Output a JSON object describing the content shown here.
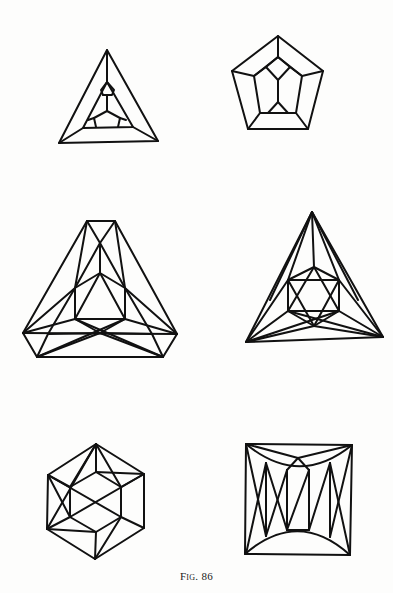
{
  "page": {
    "background": "#fdfdfc",
    "ink_color": "#111111"
  },
  "figure": {
    "caption": "Fig. 86",
    "panels": [
      {
        "id": "panel-1",
        "shape": "triangle with inner truncated triangle (tetrahedral Schlegel-type diagram)",
        "position": "top-left"
      },
      {
        "id": "panel-2",
        "shape": "pentagon (dodecahedral Schlegel-type diagram)",
        "position": "top-right"
      },
      {
        "id": "panel-3",
        "shape": "truncated triangle with internal triangulation",
        "position": "middle-left"
      },
      {
        "id": "panel-4",
        "shape": "triangle with inscribed hexagram/hexagon",
        "position": "middle-right"
      },
      {
        "id": "panel-5",
        "shape": "hexagon with inner hexagon and diagonals",
        "position": "bottom-left"
      },
      {
        "id": "panel-6",
        "shape": "square with curved arcs and zig-zag struts",
        "position": "bottom-right"
      }
    ]
  }
}
